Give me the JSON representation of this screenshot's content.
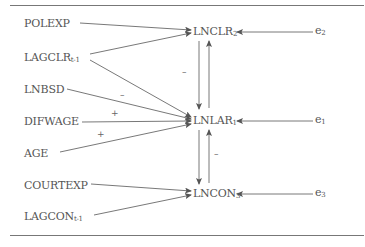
{
  "diagram": {
    "type": "path-diagram",
    "exogenous": [
      {
        "name": "POLEXP",
        "sub": ""
      },
      {
        "name": "LAGCLR",
        "sub": "t-1"
      },
      {
        "name": "LNBSD",
        "sub": ""
      },
      {
        "name": "DIFWAGE",
        "sub": ""
      },
      {
        "name": "AGE",
        "sub": ""
      },
      {
        "name": "COURTEXP",
        "sub": ""
      },
      {
        "name": "LAGCON",
        "sub": "t-1"
      }
    ],
    "endogenous": [
      {
        "name": "LNCLR",
        "sub": "2"
      },
      {
        "name": "LNLAR",
        "sub": "1"
      },
      {
        "name": "LNCON",
        "sub": "3"
      }
    ],
    "errors": [
      {
        "name": "e",
        "sub": "2"
      },
      {
        "name": "e",
        "sub": "1"
      },
      {
        "name": "e",
        "sub": "3"
      }
    ],
    "signs": {
      "lnbsd_to_lnlar": "–",
      "difwage_to_lnlar": "+",
      "age_to_lnlar": "+",
      "lnclr_lnlar": "–",
      "lncon_lnlar": "–"
    },
    "edges": [
      {
        "from": "POLEXP",
        "to": "LNCLR2"
      },
      {
        "from": "LAGCLRt-1",
        "to": "LNCLR2"
      },
      {
        "from": "LAGCLRt-1",
        "to": "LNLAR1"
      },
      {
        "from": "LNBSD",
        "to": "LNLAR1",
        "sign": "–"
      },
      {
        "from": "DIFWAGE",
        "to": "LNLAR1",
        "sign": "+"
      },
      {
        "from": "AGE",
        "to": "LNLAR1",
        "sign": "+"
      },
      {
        "from": "COURTEXP",
        "to": "LNCON3"
      },
      {
        "from": "LAGCONt-1",
        "to": "LNCON3"
      },
      {
        "from": "LNCLR2",
        "to": "LNLAR1",
        "sign": "–"
      },
      {
        "from": "LNLAR1",
        "to": "LNCLR2"
      },
      {
        "from": "LNLAR1",
        "to": "LNCON3"
      },
      {
        "from": "LNCON3",
        "to": "LNLAR1",
        "sign": "–"
      },
      {
        "from": "e2",
        "to": "LNCLR2"
      },
      {
        "from": "e1",
        "to": "LNLAR1"
      },
      {
        "from": "e3",
        "to": "LNCON3"
      }
    ]
  }
}
